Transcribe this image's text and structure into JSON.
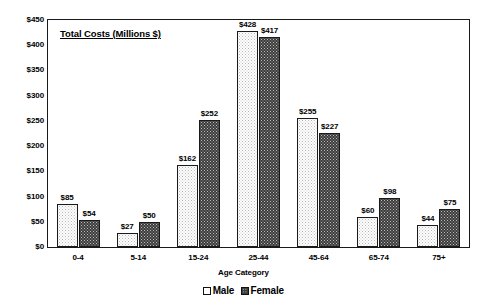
{
  "chart_data": {
    "type": "bar",
    "title": "Total Costs (Millions $)",
    "xlabel": "Age Category",
    "ylabel": "",
    "categories": [
      "0-4",
      "5-14",
      "15-24",
      "25-44",
      "45-64",
      "65-74",
      "75+"
    ],
    "series": [
      {
        "name": "Male",
        "values": [
          85,
          27,
          162,
          428,
          255,
          60,
          44
        ],
        "labels": [
          "$85",
          "$27",
          "$162",
          "$428",
          "$255",
          "$60",
          "$44"
        ],
        "fill": "light-dotted",
        "color": "#fdfdfd"
      },
      {
        "name": "Female",
        "values": [
          54,
          50,
          252,
          417,
          227,
          98,
          75
        ],
        "labels": [
          "$54",
          "$50",
          "$252",
          "$417",
          "$227",
          "$98",
          "$75"
        ],
        "fill": "dark-dotted",
        "color": "#3d3d3d"
      }
    ],
    "ylim": [
      0,
      450
    ],
    "ytick_values": [
      0,
      50,
      100,
      150,
      200,
      250,
      300,
      350,
      400,
      450
    ],
    "ytick_labels": [
      "$0",
      "$50",
      "$100",
      "$150",
      "$200",
      "$250",
      "$300",
      "$350",
      "$400",
      "$450"
    ],
    "grid": false,
    "legend_position": "bottom",
    "legend_entries": [
      "Male",
      "Female"
    ],
    "axis_color": "#1a1a1a",
    "background": "#ffffff"
  }
}
